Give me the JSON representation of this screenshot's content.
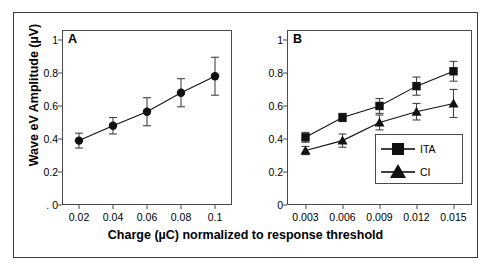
{
  "figure": {
    "xlabel": "Charge (µC) normalized to response threshold",
    "ylabel": "Wave eV Amplitude (µV)",
    "panel_a_letter": "A",
    "panel_b_letter": "B",
    "frame_color": "#3a3a3a",
    "marker_color": "#000000"
  },
  "chart_data": [
    {
      "type": "line",
      "title": "A",
      "xlabel": "Charge (µC) normalized to response threshold",
      "ylabel": "Wave eV Amplitude (µV)",
      "xlim": [
        0.01,
        0.11
      ],
      "ylim": [
        0,
        1.06
      ],
      "xticks": [
        0.02,
        0.04,
        0.06,
        0.08,
        0.1
      ],
      "xticklabels": [
        "0.02",
        "0.04",
        "0.06",
        "0.08",
        "0.1"
      ],
      "yticks": [
        0,
        0.2,
        0.4,
        0.6,
        0.8,
        1
      ],
      "yticklabels": [
        ". 0",
        "0.2",
        "0.4",
        "0.6",
        "0.8",
        "1"
      ],
      "grid": false,
      "legend": "none",
      "series": [
        {
          "name": "",
          "marker": "circle",
          "x": [
            0.02,
            0.04,
            0.06,
            0.08,
            0.1
          ],
          "values": [
            0.39,
            0.48,
            0.565,
            0.68,
            0.78
          ],
          "yerr": [
            0.045,
            0.05,
            0.085,
            0.085,
            0.115
          ]
        }
      ]
    },
    {
      "type": "line",
      "title": "B",
      "xlabel": "Charge (µC) normalized to response threshold",
      "ylabel": "Wave eV Amplitude (µV)",
      "xlim": [
        0.0015,
        0.0165
      ],
      "ylim": [
        0,
        1.06
      ],
      "xticks": [
        0.003,
        0.006,
        0.009,
        0.012,
        0.015
      ],
      "xticklabels": [
        "0.003",
        "0.006",
        "0.009",
        "0.012",
        "0.015"
      ],
      "yticks": [
        0,
        0.2,
        0.4,
        0.6,
        0.8,
        1
      ],
      "yticklabels": [
        "0",
        "0.2",
        "0.4",
        "0.6",
        "0.8",
        "1"
      ],
      "grid": false,
      "legend": "lower right",
      "series": [
        {
          "name": "ITA",
          "marker": "square",
          "x": [
            0.003,
            0.006,
            0.009,
            0.012,
            0.015
          ],
          "values": [
            0.41,
            0.53,
            0.6,
            0.72,
            0.81
          ],
          "yerr": [
            0.03,
            0.025,
            0.045,
            0.055,
            0.06
          ]
        },
        {
          "name": "CI",
          "marker": "triangle",
          "x": [
            0.003,
            0.006,
            0.009,
            0.012,
            0.015
          ],
          "values": [
            0.33,
            0.39,
            0.5,
            0.565,
            0.615
          ],
          "yerr": [
            0.025,
            0.04,
            0.045,
            0.05,
            0.085
          ]
        }
      ]
    }
  ],
  "legend": {
    "items": [
      {
        "label": "ITA",
        "marker": "square"
      },
      {
        "label": "CI",
        "marker": "triangle"
      }
    ]
  }
}
